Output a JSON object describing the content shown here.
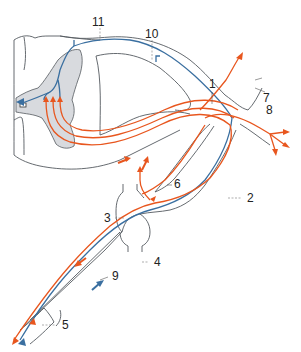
{
  "figure": {
    "colors": {
      "afferent_fiber": "#3a6fa0",
      "efferent_fiber": "#e8561e",
      "gray_matter": "#d8dade",
      "outline": "#555a60",
      "background": "#ffffff"
    },
    "labels": [
      {
        "id": "1",
        "text": "1"
      },
      {
        "id": "2",
        "text": "2"
      },
      {
        "id": "3",
        "text": "3"
      },
      {
        "id": "4",
        "text": "4"
      },
      {
        "id": "5",
        "text": "5"
      },
      {
        "id": "6",
        "text": "6"
      },
      {
        "id": "7",
        "text": "7"
      },
      {
        "id": "8",
        "text": "8"
      },
      {
        "id": "9",
        "text": "9"
      },
      {
        "id": "10",
        "text": "10"
      },
      {
        "id": "11",
        "text": "11"
      }
    ]
  }
}
